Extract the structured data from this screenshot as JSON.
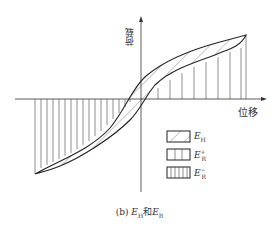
{
  "figure": {
    "axis_x_label": "位移",
    "axis_y_label": "荷载",
    "caption_prefix": "(b) ",
    "caption_e": "E",
    "caption_h_sub": "H",
    "caption_joiner": "和",
    "caption_r_sub": "R",
    "legend": [
      {
        "symbol": "E",
        "sub": "H",
        "sup": "",
        "pattern": "diagonal-hatch"
      },
      {
        "symbol": "E",
        "sub": "R",
        "sup": "+",
        "pattern": "vertical-sparse"
      },
      {
        "symbol": "E",
        "sub": "R",
        "sup": "−",
        "pattern": "vertical-dense"
      }
    ]
  }
}
